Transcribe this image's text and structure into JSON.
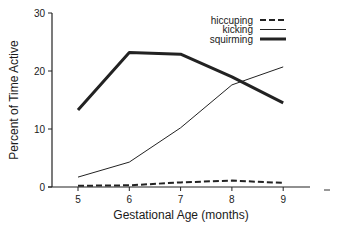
{
  "chart_data": {
    "type": "line",
    "title": "",
    "xlabel": "Gestational Age (months)",
    "ylabel": "Percent of Time Active",
    "x": [
      5,
      6,
      7,
      8,
      9
    ],
    "xticks": [
      "5",
      "6",
      "7",
      "8",
      "9"
    ],
    "yticks": [
      "0",
      "10",
      "20",
      "30"
    ],
    "ylim": [
      0,
      30
    ],
    "xlim": [
      4.5,
      9.5
    ],
    "grid": false,
    "legend_position": "top-right",
    "series": [
      {
        "name": "hiccuping",
        "style": "dashed",
        "values": [
          0.2,
          0.3,
          0.8,
          1.1,
          0.7
        ]
      },
      {
        "name": "kicking",
        "style": "thin",
        "values": [
          1.7,
          4.3,
          10.2,
          17.6,
          20.7
        ]
      },
      {
        "name": "squirming",
        "style": "thick",
        "values": [
          13.3,
          23.2,
          22.9,
          19.0,
          14.5
        ]
      }
    ]
  }
}
